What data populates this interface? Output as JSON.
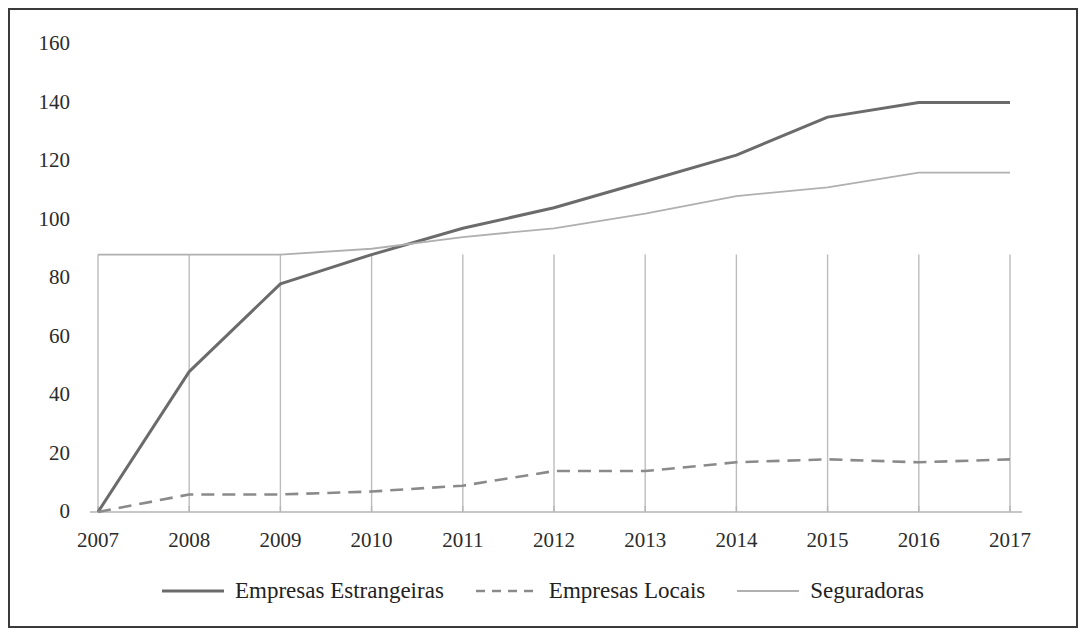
{
  "chart_data": {
    "type": "line",
    "title": "",
    "subtitle": "",
    "xlabel": "",
    "ylabel": "",
    "categories": [
      "2007",
      "2008",
      "2009",
      "2010",
      "2011",
      "2012",
      "2013",
      "2014",
      "2015",
      "2016",
      "2017"
    ],
    "x": [
      2007,
      2008,
      2009,
      2010,
      2011,
      2012,
      2013,
      2014,
      2015,
      2016,
      2017
    ],
    "ylim": [
      0,
      160
    ],
    "yticks": [
      0,
      20,
      40,
      60,
      80,
      100,
      120,
      140,
      160
    ],
    "ytick_labels": [
      "0",
      "20",
      "40",
      "60",
      "80",
      "100",
      "120",
      "140",
      "160"
    ],
    "grid": "vertical",
    "legend_position": "bottom",
    "series": [
      {
        "name": "Empresas Estrangeiras",
        "style": "solid",
        "color": "#6b6b6b",
        "width": 3.0,
        "values": [
          0,
          48,
          78,
          88,
          97,
          104,
          113,
          122,
          135,
          140,
          140
        ]
      },
      {
        "name": "Empresas Locais",
        "style": "dashed",
        "color": "#8a8a8a",
        "width": 2.6,
        "values": [
          0,
          6,
          6,
          7,
          9,
          14,
          14,
          17,
          18,
          17,
          18
        ]
      },
      {
        "name": "Seguradoras",
        "style": "solid",
        "color": "#b0b0b0",
        "width": 1.8,
        "values": [
          88,
          88,
          88,
          90,
          94,
          97,
          102,
          108,
          111,
          116,
          116
        ]
      }
    ]
  },
  "figure": {
    "border_color": "#3a3a3a",
    "background": "#ffffff",
    "gridline_color": "#bdbdbd",
    "axis_color": "#b5b5b5",
    "tick_text_color": "#2b2b2b"
  },
  "legend": {
    "entries": [
      {
        "label": "Empresas Estrangeiras",
        "swatch": "solid-line-swatch"
      },
      {
        "label": "Empresas Locais",
        "swatch": "dashed-line-swatch"
      },
      {
        "label": "Seguradoras",
        "swatch": "light-solid-line-swatch"
      }
    ]
  }
}
